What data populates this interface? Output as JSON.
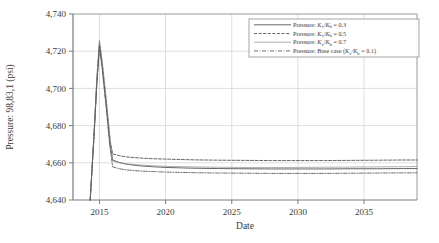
{
  "chart_data": {
    "type": "line",
    "title": "",
    "xlabel": "Date",
    "ylabel": "Pressure: 98,83,1 (psi)",
    "xlim": [
      2013.0,
      2039.0
    ],
    "ylim": [
      4640,
      4740
    ],
    "xticks": [
      "2015",
      "2020",
      "2025",
      "2030",
      "2035"
    ],
    "xtick_values": [
      2015,
      2020,
      2025,
      2030,
      2035
    ],
    "yticks": [
      "4,640",
      "4,660",
      "4,680",
      "4,700",
      "4,720",
      "4,740"
    ],
    "ytick_values": [
      4640,
      4660,
      4680,
      4700,
      4720,
      4740
    ],
    "grid": true,
    "legend_position": "upper right",
    "x": [
      2014.3,
      2014.6,
      2014.8,
      2015.0,
      2015.2,
      2015.5,
      2015.8,
      2016.0,
      2016.5,
      2017.0,
      2018.0,
      2019.0,
      2020.0,
      2022.0,
      2024.0,
      2026.0,
      2028.0,
      2030.0,
      2032.0,
      2034.0,
      2036.0,
      2038.0,
      2039.0
    ],
    "series": [
      {
        "name": "Pressure: Kv/Kh = 0.3",
        "label_prefix": "Pressure: ",
        "label_num": "K",
        "label_sub1": "v",
        "label_div": "/K",
        "label_sub2": "h",
        "label_suffix": " = 0.3",
        "style": "solid",
        "color": "#4a4a4a",
        "values": [
          4640.0,
          4676.0,
          4703.0,
          4723.0,
          4712.0,
          4692.0,
          4670.0,
          4661.5,
          4660.2,
          4659.3,
          4658.4,
          4657.9,
          4657.5,
          4657.1,
          4656.9,
          4656.8,
          4656.7,
          4656.7,
          4656.7,
          4656.8,
          4656.8,
          4656.9,
          4656.9
        ]
      },
      {
        "name": "Pressure: Kv/Kh = 0.5",
        "label_prefix": "Pressure: ",
        "label_num": "K",
        "label_sub1": "v",
        "label_div": "/K",
        "label_sub2": "h",
        "label_suffix": " = 0.5",
        "style": "dashed",
        "color": "#4a4a4a",
        "values": [
          4640.0,
          4677.0,
          4704.5,
          4725.0,
          4714.0,
          4694.0,
          4672.0,
          4664.8,
          4663.8,
          4663.2,
          4662.6,
          4662.2,
          4662.0,
          4661.6,
          4661.4,
          4661.3,
          4661.2,
          4661.2,
          4661.2,
          4661.3,
          4661.4,
          4661.5,
          4661.5
        ]
      },
      {
        "name": "Pressure: Kv/Kh = 0.7",
        "label_prefix": "Pressure: ",
        "label_num": "K",
        "label_sub1": "v",
        "label_div": "/K",
        "label_sub2": "h",
        "label_suffix": " = 0.7",
        "style": "solid-fine",
        "color": "#8c8c8c",
        "values": [
          4640.0,
          4677.5,
          4705.5,
          4726.0,
          4715.0,
          4695.0,
          4673.0,
          4661.0,
          4660.0,
          4659.4,
          4658.8,
          4658.4,
          4658.1,
          4657.8,
          4657.6,
          4657.5,
          4657.5,
          4657.5,
          4657.6,
          4657.7,
          4657.8,
          4657.9,
          4658.0
        ]
      },
      {
        "name": "Pressure: Base case (Kv/Kh = 0.1)",
        "label_prefix": "Pressure: Base case (",
        "label_num": "K",
        "label_sub1": "v",
        "label_div": "/K",
        "label_sub2": "h",
        "label_suffix": " = 0.1)",
        "style": "dashdot",
        "color": "#5a5a5a",
        "values": [
          4640.0,
          4675.0,
          4702.0,
          4722.0,
          4711.0,
          4690.0,
          4668.0,
          4657.8,
          4656.8,
          4656.2,
          4655.6,
          4655.3,
          4655.0,
          4654.7,
          4654.5,
          4654.4,
          4654.3,
          4654.3,
          4654.3,
          4654.4,
          4654.5,
          4654.6,
          4654.6
        ]
      }
    ]
  }
}
